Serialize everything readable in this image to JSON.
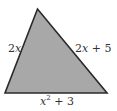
{
  "diagram": {
    "shape": "triangle",
    "fill_color": "#a8a8a8",
    "stroke_color": "#2a2a2a",
    "vertices": {
      "apex": [
        37.5,
        9
      ],
      "bottom_left": [
        5,
        93
      ],
      "bottom_right": [
        107,
        93
      ]
    },
    "sides": {
      "left": {
        "coef": "2",
        "var": "x",
        "rest": ""
      },
      "right": {
        "coef": "2",
        "var": "x",
        "rest": " + 5"
      },
      "bottom": {
        "var": "x",
        "exp": "2",
        "rest": " + 3"
      }
    }
  }
}
